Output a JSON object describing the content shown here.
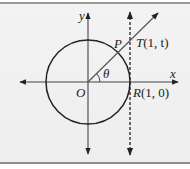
{
  "figure": {
    "labels": {
      "y_axis": "y",
      "x_axis": "x",
      "origin": "O",
      "angle": "θ",
      "point_p": "P",
      "point_t_name": "T",
      "point_t_coords": "(1, t)",
      "point_r_name": "R",
      "point_r_coords": "(1, 0)"
    },
    "colors": {
      "background": "#efefef",
      "stroke": "#222222",
      "border": "#999999"
    }
  }
}
